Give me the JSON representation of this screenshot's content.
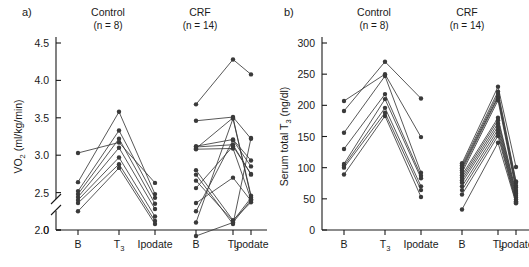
{
  "figure": {
    "panels": [
      {
        "label": "a)",
        "groups": [
          {
            "title": "Control",
            "n_text": "(n = 8)",
            "n": 8
          },
          {
            "title": "CRF",
            "n_text": "(n = 14)",
            "n": 14
          }
        ]
      },
      {
        "label": "b)",
        "groups": [
          {
            "title": "Control",
            "n_text": "(n = 8)",
            "n": 8
          },
          {
            "title": "CRF",
            "n_text": "(n = 14)",
            "n": 14
          }
        ]
      }
    ]
  },
  "chart_data": [
    {
      "type": "line",
      "panel": "a)",
      "title": "",
      "ylabel": "VO2 (ml/kg/min)",
      "ylabel_parts": {
        "main_pre": "VO",
        "sub": "2",
        "main_post": " (ml/kg/min)"
      },
      "xlabel": "",
      "categories": [
        "B",
        "T3",
        "Ipodate",
        "B",
        "T3",
        "Ipodate"
      ],
      "xtick_labels": [
        {
          "text": "B",
          "sub": ""
        },
        {
          "text": "T",
          "sub": "3"
        },
        {
          "text": "Ipodate",
          "sub": ""
        },
        {
          "text": "B",
          "sub": ""
        },
        {
          "text": "T",
          "sub": "3"
        },
        {
          "text": "Ipodate",
          "sub": ""
        }
      ],
      "ytick_labels": [
        "0",
        "2.0",
        "2.5",
        "3.0",
        "3.5",
        "4.0",
        "4.5"
      ],
      "ytick_values": [
        0,
        2.0,
        2.5,
        3.0,
        3.5,
        4.0,
        4.5
      ],
      "ylim": [
        2.0,
        4.5
      ],
      "axis_break": true,
      "grid": false,
      "legend": "none",
      "groups": [
        {
          "name": "Control",
          "n": 8,
          "x": [
            "B",
            "T3",
            "Ipodate"
          ],
          "series": [
            {
              "name": "s1",
              "values": [
                3.03,
                3.17,
                2.63
              ]
            },
            {
              "name": "s2",
              "values": [
                2.64,
                3.58,
                2.48
              ]
            },
            {
              "name": "s3",
              "values": [
                2.52,
                3.33,
                2.43
              ]
            },
            {
              "name": "s4",
              "values": [
                2.48,
                3.22,
                2.35
              ]
            },
            {
              "name": "s5",
              "values": [
                2.44,
                3.1,
                2.28
              ]
            },
            {
              "name": "s6",
              "values": [
                2.4,
                2.97,
                2.18
              ]
            },
            {
              "name": "s7",
              "values": [
                2.36,
                2.88,
                2.12
              ]
            },
            {
              "name": "s8",
              "values": [
                2.25,
                2.83,
                2.08
              ]
            }
          ]
        },
        {
          "name": "CRF",
          "n": 14,
          "x": [
            "B",
            "T3",
            "Ipodate"
          ],
          "series": [
            {
              "name": "s1",
              "values": [
                3.68,
                4.28,
                4.08
              ]
            },
            {
              "name": "s2",
              "values": [
                3.46,
                3.51,
                3.22
              ]
            },
            {
              "name": "s3",
              "values": [
                3.12,
                3.21,
                2.93
              ]
            },
            {
              "name": "s4",
              "values": [
                3.11,
                3.14,
                2.74
              ]
            },
            {
              "name": "s5",
              "values": [
                3.09,
                3.5,
                2.46
              ]
            },
            {
              "name": "s6",
              "values": [
                3.08,
                3.09,
                2.41
              ]
            },
            {
              "name": "s7",
              "values": [
                2.8,
                2.13,
                2.37
              ]
            },
            {
              "name": "s8",
              "values": [
                2.74,
                2.08,
                3.23
              ]
            },
            {
              "name": "s9",
              "values": [
                2.66,
                2.12,
                2.43
              ]
            },
            {
              "name": "s10",
              "values": [
                2.56,
                3.12,
                2.75
              ]
            },
            {
              "name": "s11",
              "values": [
                2.36,
                2.7,
                2.39
              ]
            },
            {
              "name": "s12",
              "values": [
                2.25,
                3.2,
                2.85
              ]
            },
            {
              "name": "s13",
              "values": [
                2.1,
                3.49,
                2.44
              ]
            },
            {
              "name": "s14",
              "values": [
                1.92,
                2.1,
                2.4
              ]
            }
          ]
        }
      ]
    },
    {
      "type": "line",
      "panel": "b)",
      "title": "",
      "ylabel": "Serum total T3 (ng/dl)",
      "ylabel_parts": {
        "main_pre": "Serum total T",
        "sub": "3",
        "main_post": " (ng/dl)"
      },
      "xlabel": "",
      "categories": [
        "B",
        "T3",
        "Ipodate",
        "B",
        "T3",
        "Ipodate"
      ],
      "xtick_labels": [
        {
          "text": "B",
          "sub": ""
        },
        {
          "text": "T",
          "sub": "3"
        },
        {
          "text": "Ipodate",
          "sub": ""
        },
        {
          "text": "B",
          "sub": ""
        },
        {
          "text": "T",
          "sub": "3"
        },
        {
          "text": "Ipodate",
          "sub": ""
        }
      ],
      "ytick_labels": [
        "0",
        "50",
        "100",
        "150",
        "200",
        "250",
        "300"
      ],
      "ytick_values": [
        0,
        50,
        100,
        150,
        200,
        250,
        300
      ],
      "ylim": [
        0,
        300
      ],
      "axis_break": false,
      "grid": false,
      "legend": "none",
      "groups": [
        {
          "name": "Control",
          "n": 8,
          "x": [
            "B",
            "T3",
            "Ipodate"
          ],
          "series": [
            {
              "name": "s1",
              "values": [
                207,
                250,
                149
              ]
            },
            {
              "name": "s2",
              "values": [
                191,
                270,
                211
              ]
            },
            {
              "name": "s3",
              "values": [
                156,
                247,
                92
              ]
            },
            {
              "name": "s4",
              "values": [
                130,
                218,
                87
              ]
            },
            {
              "name": "s5",
              "values": [
                106,
                210,
                83
              ]
            },
            {
              "name": "s6",
              "values": [
                103,
                196,
                70
              ]
            },
            {
              "name": "s7",
              "values": [
                100,
                188,
                64
              ]
            },
            {
              "name": "s8",
              "values": [
                89,
                183,
                53
              ]
            }
          ]
        },
        {
          "name": "CRF",
          "n": 14,
          "x": [
            "B",
            "T3",
            "Ipodate"
          ],
          "series": [
            {
              "name": "s1",
              "values": [
                107,
                230,
                101
              ]
            },
            {
              "name": "s2",
              "values": [
                104,
                222,
                78
              ]
            },
            {
              "name": "s3",
              "values": [
                101,
                218,
                76
              ]
            },
            {
              "name": "s4",
              "values": [
                99,
                214,
                71
              ]
            },
            {
              "name": "s5",
              "values": [
                96,
                212,
                68
              ]
            },
            {
              "name": "s6",
              "values": [
                92,
                208,
                64
              ]
            },
            {
              "name": "s7",
              "values": [
                88,
                180,
                61
              ]
            },
            {
              "name": "s8",
              "values": [
                84,
                176,
                58
              ]
            },
            {
              "name": "s9",
              "values": [
                80,
                171,
                55
              ]
            },
            {
              "name": "s10",
              "values": [
                76,
                166,
                52
              ]
            },
            {
              "name": "s11",
              "values": [
                70,
                161,
                49
              ]
            },
            {
              "name": "s12",
              "values": [
                64,
                156,
                46
              ]
            },
            {
              "name": "s13",
              "values": [
                57,
                151,
                44
              ]
            },
            {
              "name": "s14",
              "values": [
                33,
                140,
                43
              ]
            }
          ]
        }
      ]
    }
  ]
}
